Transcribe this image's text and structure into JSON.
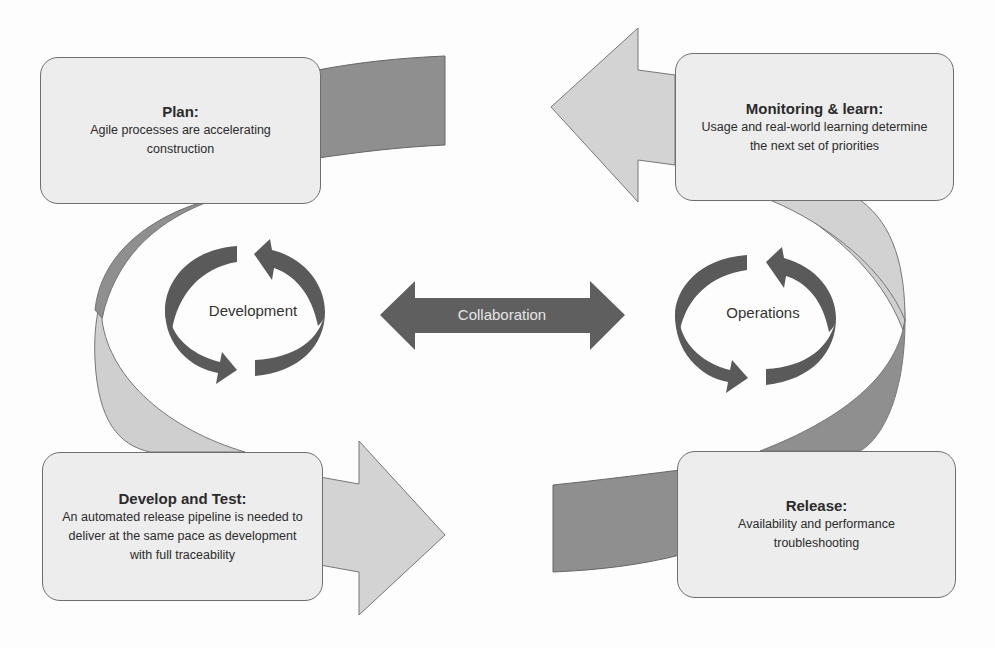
{
  "diagram": {
    "type": "devops-lifecycle",
    "colors": {
      "box_fill": "#ededed",
      "box_border": "#6e6e6e",
      "dark_band": "#8a8a8a",
      "light_band": "#cfcfcf",
      "cycle_arrows": "#5a5a5a",
      "collab_arrow": "#5f5f5f",
      "collab_text": "#e6e6e6",
      "text": "#2b2b2b"
    },
    "stages": [
      {
        "id": "plan",
        "title": "Plan:",
        "description": "Agile processes are accelerating construction"
      },
      {
        "id": "monitoring",
        "title": "Monitoring & learn:",
        "description": "Usage and real-world learning determine the next set of priorities"
      },
      {
        "id": "develop-test",
        "title": "Develop and Test:",
        "description": "An automated release pipeline is needed to deliver at the same pace as development with full traceability"
      },
      {
        "id": "release",
        "title": "Release:",
        "description": "Availability and performance troubleshooting"
      }
    ],
    "cycles": [
      {
        "id": "development",
        "label": "Development"
      },
      {
        "id": "operations",
        "label": "Operations"
      }
    ],
    "connector": {
      "label": "Collaboration",
      "direction": "bidirectional"
    }
  }
}
